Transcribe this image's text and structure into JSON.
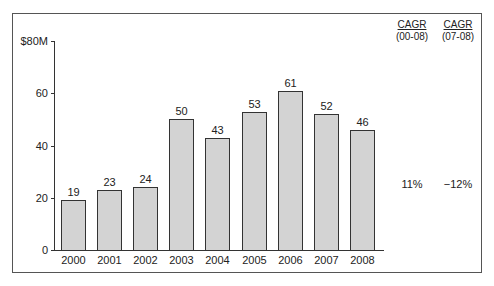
{
  "chart_data": {
    "type": "bar",
    "title": "",
    "xlabel": "",
    "ylabel": "",
    "categories": [
      "2000",
      "2001",
      "2002",
      "2003",
      "2004",
      "2005",
      "2006",
      "2007",
      "2008"
    ],
    "values": [
      19,
      23,
      24,
      50,
      43,
      53,
      61,
      52,
      46
    ],
    "ylim": [
      0,
      80
    ],
    "yticks": [
      "0",
      "20",
      "40",
      "60",
      "$80M"
    ],
    "grid": false,
    "data_labels": [
      "19",
      "23",
      "24",
      "50",
      "43",
      "53",
      "61",
      "52",
      "46"
    ],
    "annotations": [
      {
        "header": "CAGR",
        "period": "(00-08)",
        "value": "11%"
      },
      {
        "header": "CAGR",
        "period": "(07-08)",
        "value": "−12%"
      }
    ]
  },
  "axis": {
    "y_ticks": [
      {
        "label": "0",
        "value": 0
      },
      {
        "label": "20",
        "value": 20
      },
      {
        "label": "40",
        "value": 40
      },
      {
        "label": "60",
        "value": 60
      },
      {
        "label": "$80M",
        "value": 80
      }
    ]
  },
  "cagr": [
    {
      "header": "CAGR",
      "period": "(00-08)",
      "value": "11%"
    },
    {
      "header": "CAGR",
      "period": "(07-08)",
      "value": "−12%"
    }
  ]
}
